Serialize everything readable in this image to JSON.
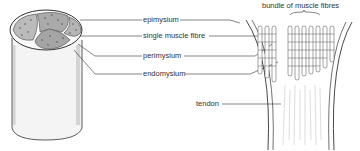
{
  "diagram": {
    "left_figure": "muscle cross-section cylinder",
    "right_figure": "muscle to tendon junction",
    "labels": {
      "epimysium": "epimysium",
      "single_fibre": "single muscle fibre",
      "perimysium": "perimysium",
      "endomysium": "endomysium",
      "bundle": "bundle of muscle fibres",
      "tendon": "tendon"
    },
    "colors": {
      "line": "#333333",
      "shade": "#888888",
      "bg": "#ffffff"
    }
  }
}
